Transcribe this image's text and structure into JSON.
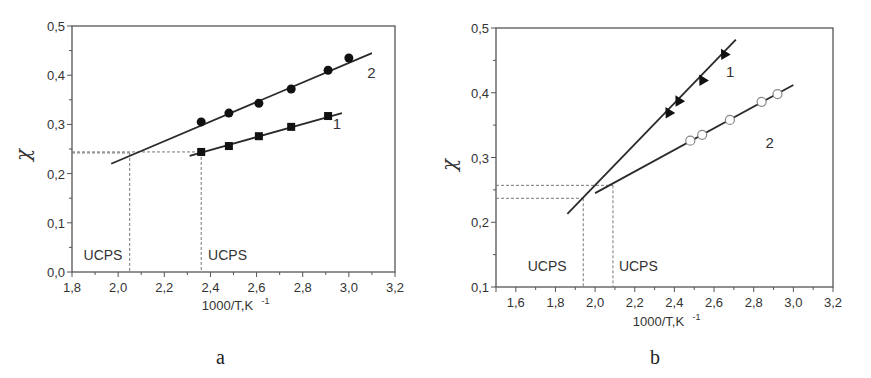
{
  "chart_data": [
    {
      "panel": "a",
      "type": "scatter",
      "title": "",
      "xlabel": "1000/T,K",
      "xlabel_sup": "-1",
      "ylabel": "χ",
      "xlim": [
        1.8,
        3.2
      ],
      "ylim": [
        0.0,
        0.5
      ],
      "xticks": [
        "1,8",
        "2,0",
        "2,2",
        "2,4",
        "2,6",
        "2,8",
        "3,0",
        "3,2"
      ],
      "xtick_values": [
        1.8,
        2.0,
        2.2,
        2.4,
        2.6,
        2.8,
        3.0,
        3.2
      ],
      "yticks": [
        "0,0",
        "0,1",
        "0,2",
        "0,3",
        "0,4",
        "0,5"
      ],
      "ytick_values": [
        0.0,
        0.1,
        0.2,
        0.3,
        0.4,
        0.5
      ],
      "grid": false,
      "series": [
        {
          "name": "1",
          "marker": "square-filled",
          "x": [
            2.36,
            2.48,
            2.61,
            2.75,
            2.91
          ],
          "y": [
            0.244,
            0.256,
            0.276,
            0.295,
            0.317
          ],
          "fit_line": {
            "x": [
              2.31,
              2.97
            ],
            "y": [
              0.236,
              0.323
            ]
          },
          "label_pos": {
            "x": 2.93,
            "y": 0.29
          }
        },
        {
          "name": "2",
          "marker": "circle-filled",
          "x": [
            2.36,
            2.48,
            2.61,
            2.75,
            2.91,
            3.0
          ],
          "y": [
            0.305,
            0.323,
            0.343,
            0.372,
            0.41,
            0.435
          ],
          "fit_line": {
            "x": [
              1.97,
              3.1
            ],
            "y": [
              0.22,
              0.445
            ]
          },
          "label_pos": {
            "x": 3.08,
            "y": 0.395
          }
        }
      ],
      "annotations": [
        {
          "text": "UCPS",
          "x": 1.85,
          "y": 0.025
        },
        {
          "text": "UCPS",
          "x": 2.39,
          "y": 0.025
        }
      ],
      "guides": [
        {
          "x": 2.05,
          "y": 0.242
        },
        {
          "x": 2.36,
          "y": 0.244
        }
      ]
    },
    {
      "panel": "b",
      "type": "scatter",
      "title": "",
      "xlabel": "1000/T,K",
      "xlabel_sup": "-1",
      "ylabel": "χ",
      "xlim": [
        1.5,
        3.2
      ],
      "ylim": [
        0.1,
        0.5
      ],
      "xticks": [
        "1,6",
        "1,8",
        "2,0",
        "2,2",
        "2,4",
        "2,6",
        "2,8",
        "3,0",
        "3,2"
      ],
      "xtick_values": [
        1.6,
        1.8,
        2.0,
        2.2,
        2.4,
        2.6,
        2.8,
        3.0,
        3.2
      ],
      "yticks": [
        "0,1",
        "0,2",
        "0,3",
        "0,4",
        "0,5"
      ],
      "ytick_values": [
        0.1,
        0.2,
        0.3,
        0.4,
        0.5
      ],
      "grid": false,
      "series": [
        {
          "name": "1",
          "marker": "triangle-filled",
          "x": [
            2.37,
            2.42,
            2.54,
            2.65
          ],
          "y": [
            0.37,
            0.388,
            0.42,
            0.46
          ],
          "fit_line": {
            "x": [
              1.86,
              2.71
            ],
            "y": [
              0.213,
              0.482
            ]
          },
          "label_pos": {
            "x": 2.66,
            "y": 0.425
          }
        },
        {
          "name": "2",
          "marker": "circle-open",
          "x": [
            2.48,
            2.54,
            2.68,
            2.84,
            2.92
          ],
          "y": [
            0.326,
            0.335,
            0.358,
            0.386,
            0.398
          ],
          "fit_line": {
            "x": [
              2.0,
              3.0
            ],
            "y": [
              0.245,
              0.412
            ]
          },
          "label_pos": {
            "x": 2.86,
            "y": 0.315
          }
        }
      ],
      "annotations": [
        {
          "text": "UCPS",
          "x": 1.66,
          "y": 0.125
        },
        {
          "text": "UCPS",
          "x": 2.12,
          "y": 0.125
        }
      ],
      "guides": [
        {
          "x": 1.94,
          "y": 0.237
        },
        {
          "x": 2.09,
          "y": 0.257
        }
      ]
    }
  ],
  "panels": {
    "a": {
      "label": "a",
      "ylabel": "χ",
      "xlabel": "1000/T,K",
      "xlabel_sup": "-1",
      "ucps": "UCPS",
      "series1": "1",
      "series2": "2"
    },
    "b": {
      "label": "b",
      "ylabel": "χ",
      "xlabel": "1000/T,K",
      "xlabel_sup": "-1",
      "ucps": "UCPS",
      "series1": "1",
      "series2": "2"
    }
  },
  "colors": {
    "axis": "#555555",
    "line": "#2a2a2a",
    "marker": "#111111",
    "open_marker": "#888888",
    "guide": "#777777"
  }
}
